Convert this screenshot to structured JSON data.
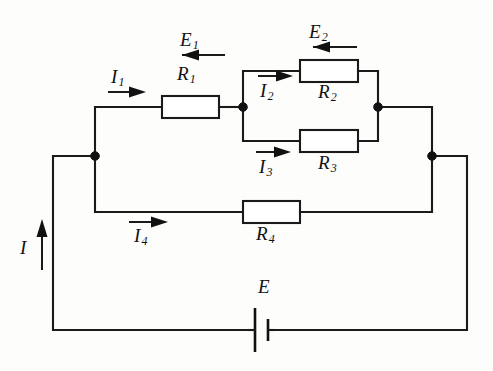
{
  "diagram": {
    "type": "electrical-circuit-schematic",
    "stroke_color": "#1a1a1a",
    "background_color": "#fdfdfc",
    "labels": {
      "emf_1": {
        "symbol": "E",
        "subscript": "1"
      },
      "emf_2": {
        "symbol": "E",
        "subscript": "2"
      },
      "emf_main": {
        "symbol": "E",
        "subscript": ""
      },
      "resistor_1": {
        "symbol": "R",
        "subscript": "1"
      },
      "resistor_2": {
        "symbol": "R",
        "subscript": "2"
      },
      "resistor_3": {
        "symbol": "R",
        "subscript": "3"
      },
      "resistor_4": {
        "symbol": "R",
        "subscript": "4"
      },
      "current_1": {
        "symbol": "I",
        "subscript": "1"
      },
      "current_2": {
        "symbol": "I",
        "subscript": "2"
      },
      "current_3": {
        "symbol": "I",
        "subscript": "3"
      },
      "current_4": {
        "symbol": "I",
        "subscript": "4"
      },
      "current_total": {
        "symbol": "I",
        "subscript": ""
      }
    },
    "components": [
      {
        "name": "resistor-r1",
        "label": "R1",
        "branch": "top-left-branch"
      },
      {
        "name": "resistor-r2",
        "label": "R2",
        "branch": "parallel-upper-branch"
      },
      {
        "name": "resistor-r3",
        "label": "R3",
        "branch": "parallel-lower-branch"
      },
      {
        "name": "resistor-r4",
        "label": "R4",
        "branch": "middle-branch"
      },
      {
        "name": "battery-e",
        "label": "E",
        "branch": "bottom-branch"
      }
    ],
    "current_arrows": [
      {
        "name": "current-i1",
        "label": "I1",
        "direction": "right"
      },
      {
        "name": "current-i2",
        "label": "I2",
        "direction": "right"
      },
      {
        "name": "current-i3",
        "label": "I3",
        "direction": "right"
      },
      {
        "name": "current-i4",
        "label": "I4",
        "direction": "right"
      },
      {
        "name": "current-i",
        "label": "I",
        "direction": "up"
      }
    ],
    "emf_arrows": [
      {
        "name": "emf-arrow-e1",
        "label": "E1",
        "direction": "left"
      },
      {
        "name": "emf-arrow-e2",
        "label": "E2",
        "direction": "left"
      }
    ]
  }
}
